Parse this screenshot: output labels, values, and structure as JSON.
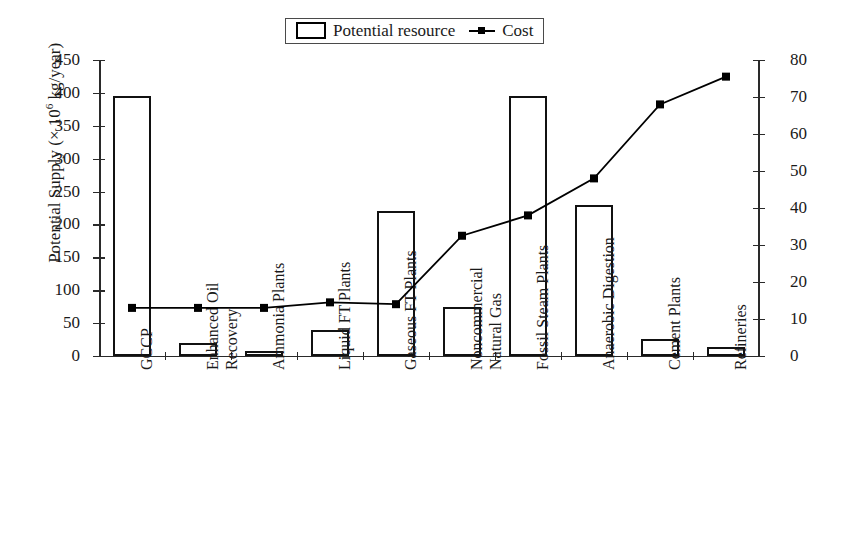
{
  "legend": {
    "entries": [
      {
        "label": "Potential resource",
        "icon": "bar-swatch-icon",
        "type": "bar"
      },
      {
        "label": "Cost",
        "icon": "line-marker-swatch-icon",
        "type": "line"
      }
    ]
  },
  "axes": {
    "left": {
      "title_prefix": "Potential Supply (× 10",
      "title_exponent": "6",
      "title_suffix": " kg/year)",
      "title_full": "Potential Supply (× 10⁶ kg/year)",
      "ticks": [
        "450",
        "400",
        "350",
        "300",
        "250",
        "200",
        "150",
        "100",
        "50",
        "0"
      ],
      "min": 0,
      "max": 450,
      "step": 50
    },
    "right": {
      "title_full": "Cost ($1986/tonne)",
      "ticks": [
        "80",
        "70",
        "60",
        "50",
        "40",
        "30",
        "20",
        "10",
        "0"
      ],
      "min": 0,
      "max": 80,
      "step": 10
    }
  },
  "categories": [
    {
      "line1": "GCCP",
      "line2": ""
    },
    {
      "line1": "Enhanced Oil",
      "line2": "Recovery"
    },
    {
      "line1": "Ammonia Plants",
      "line2": ""
    },
    {
      "line1": "Liquid FT Plants",
      "line2": ""
    },
    {
      "line1": "Gaseous FT Plants",
      "line2": ""
    },
    {
      "line1": "Noncommercial",
      "line2": "Natural Gas"
    },
    {
      "line1": "Fossil Steam Plants",
      "line2": ""
    },
    {
      "line1": "Anaerobic Digestion",
      "line2": ""
    },
    {
      "line1": "Cement Plants",
      "line2": ""
    },
    {
      "line1": "Refineries",
      "line2": ""
    }
  ],
  "colors": {
    "bar_stroke": "#111111",
    "bar_fill": "#ffffff",
    "line": "#000000",
    "axis": "#2a2a2a",
    "text": "#1a1a1a",
    "background": "#ffffff"
  },
  "chart_data": {
    "type": "bar",
    "title": "",
    "xlabel": "",
    "ylabel": "Potential Supply (× 10⁶ kg/year)",
    "y2label": "Cost ($1986/tonne)",
    "ylim": [
      0,
      450
    ],
    "y2lim": [
      0,
      80
    ],
    "grid": false,
    "legend_position": "top-center",
    "categories": [
      "GCCP",
      "Enhanced Oil Recovery",
      "Ammonia Plants",
      "Liquid FT Plants",
      "Gaseous FT Plants",
      "Noncommercial Natural Gas",
      "Fossil Steam Plants",
      "Anaerobic Digestion",
      "Cement Plants",
      "Refineries"
    ],
    "series": [
      {
        "name": "Potential resource",
        "type": "bar",
        "axis": "left",
        "unit": "× 10^6 kg/year",
        "values": [
          395,
          20,
          8,
          40,
          220,
          75,
          395,
          230,
          26,
          13
        ]
      },
      {
        "name": "Cost",
        "type": "line",
        "axis": "right",
        "unit": "$1986/tonne",
        "values": [
          13,
          13,
          13,
          14.5,
          14,
          32.5,
          38,
          48,
          68,
          75.5
        ]
      }
    ]
  }
}
